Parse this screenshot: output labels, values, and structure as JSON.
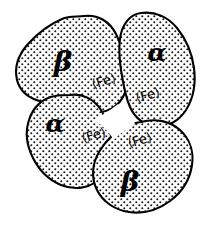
{
  "figure": {
    "name": "hemoglobin-tetramer",
    "background_color": "#ffffff",
    "outline_color": "#000000",
    "stipple_color": "#1a1a1a",
    "width": 212,
    "height": 225
  },
  "subunits": [
    {
      "id": "beta-upper-left",
      "label": "β",
      "label_x": 63,
      "label_y": 63,
      "label_size": 28,
      "heme_label": "⟨Fe⟩",
      "heme_x": 104,
      "heme_y": 82,
      "heme_size": 13,
      "heme_rotation": -16
    },
    {
      "id": "alpha-upper-right",
      "label": "α",
      "label_x": 157,
      "label_y": 54,
      "label_size": 25,
      "heme_label": "⟨Fe⟩",
      "heme_x": 148,
      "heme_y": 96,
      "heme_size": 13,
      "heme_rotation": -16
    },
    {
      "id": "alpha-lower-left",
      "label": "α",
      "label_x": 55,
      "label_y": 125,
      "label_size": 25,
      "heme_label": "⟨Fe⟩",
      "heme_x": 94,
      "heme_y": 136,
      "heme_size": 13,
      "heme_rotation": -16
    },
    {
      "id": "beta-lower-right",
      "label": "β",
      "label_x": 130,
      "label_y": 183,
      "label_size": 28,
      "heme_label": "⟨Fe⟩",
      "heme_x": 140,
      "heme_y": 141,
      "heme_size": 13,
      "heme_rotation": -16
    }
  ],
  "central_cavity": {
    "name": "central-cavity",
    "fill": "#ffffff"
  }
}
